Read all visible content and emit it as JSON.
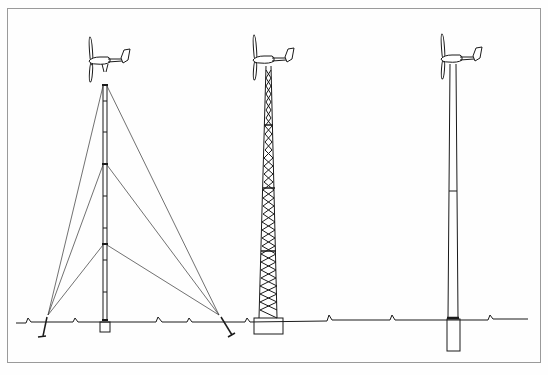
{
  "figure": {
    "towers": [
      {
        "type": "guyed-lattice-mast",
        "label": ""
      },
      {
        "type": "free-standing-lattice-tower",
        "label": ""
      },
      {
        "type": "free-standing-tubular-tower",
        "label": ""
      }
    ],
    "colors": {
      "line": "#1a1a1a",
      "guy": "#333333",
      "frame": "#9a9a9a",
      "background": "#fefefe"
    }
  }
}
